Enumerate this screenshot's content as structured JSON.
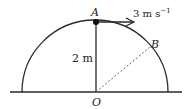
{
  "diagram": {
    "points": {
      "A": "A",
      "B": "B",
      "O": "O"
    },
    "velocity_label": "3 m s",
    "velocity_exponent": "−1",
    "radius_label": "2 m",
    "colors": {
      "stroke": "#2a2a2a",
      "dashed": "#666666",
      "background": "#ffffff"
    }
  }
}
